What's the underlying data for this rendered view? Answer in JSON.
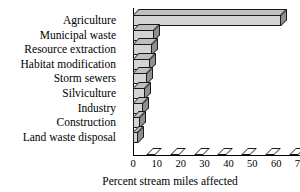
{
  "chart_data": {
    "type": "bar",
    "orientation": "horizontal",
    "title": "",
    "xlabel": "Percent stream miles affected",
    "ylabel": "",
    "categories": [
      "Agriculture",
      "Municipal waste",
      "Resource extraction",
      "Habitat modification",
      "Storm sewers",
      "Silviculture",
      "Industry",
      "Construction",
      "Land waste disposal"
    ],
    "values": [
      62,
      9,
      8,
      7,
      6,
      5,
      4,
      3,
      2
    ],
    "xlim": [
      0,
      70
    ],
    "xticks": [
      0,
      10,
      20,
      30,
      40,
      50,
      60,
      70
    ],
    "xticklabels": [
      "0",
      "10",
      "20",
      "30",
      "40",
      "50",
      "60",
      "70"
    ],
    "grid": false,
    "legend": false,
    "style": "3d-bars-grayscale",
    "colors": {
      "bar_face": "#d4d4d4",
      "bar_top": "#bfbfbf",
      "bar_side": "#8f8f8f",
      "outline": "#1a1a1a",
      "axis": "#000000",
      "background": "#ffffff"
    }
  }
}
